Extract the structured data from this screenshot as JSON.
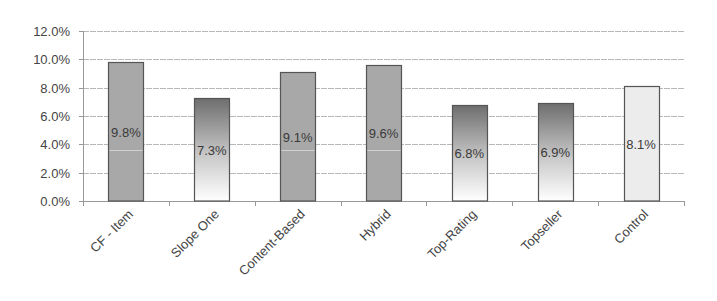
{
  "chart_data": {
    "type": "bar",
    "title": "",
    "xlabel": "",
    "ylabel": "",
    "categories": [
      "CF - Item",
      "Slope One",
      "Content-Based",
      "Hybrid",
      "Top-Rating",
      "Topseller",
      "Control"
    ],
    "values": [
      9.8,
      7.3,
      9.1,
      9.6,
      6.8,
      6.9,
      8.1
    ],
    "data_labels": [
      "9.8%",
      "7.3%",
      "9.1%",
      "9.6%",
      "6.8%",
      "6.9%",
      "8.1%"
    ],
    "fill_styles": [
      "solid-gray",
      "gradient-dark-to-white",
      "solid-gray",
      "solid-gray",
      "gradient-dark-to-white",
      "gradient-dark-to-white",
      "solid-light"
    ],
    "ylim": [
      0,
      12
    ],
    "yticks": [
      0,
      2,
      4,
      6,
      8,
      10,
      12
    ],
    "ytick_labels": [
      "0.0%",
      "2.0%",
      "4.0%",
      "6.0%",
      "8.0%",
      "10.0%",
      "12.0%"
    ],
    "grid": true,
    "legend": null,
    "xtick_rotation": -45
  },
  "colors": {
    "solid_gray": "#a8a8a8",
    "gradient_top": "#6e6e6e",
    "gradient_bottom": "#ffffff",
    "solid_light": "#ececec",
    "bar_border": "#555555",
    "gridline": "#b8b8b8",
    "axis": "#999999",
    "text": "#444444"
  }
}
